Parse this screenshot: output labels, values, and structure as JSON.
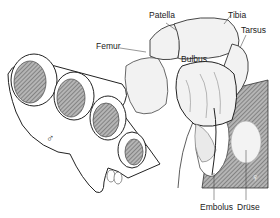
{
  "diagram": {
    "labels": {
      "patella": "Patella",
      "tibia": "Tibia",
      "tarsus": "Tarsus",
      "femur": "Femur",
      "bulbus": "Bulbus",
      "embolus": "Embolus",
      "druse": "Drüse"
    },
    "symbols": {
      "male": "♂",
      "female": "♀"
    },
    "colors": {
      "line": "#222222",
      "hatch": "#8a8a8a",
      "fill": "#f2f2f2",
      "background": "#ffffff"
    }
  }
}
